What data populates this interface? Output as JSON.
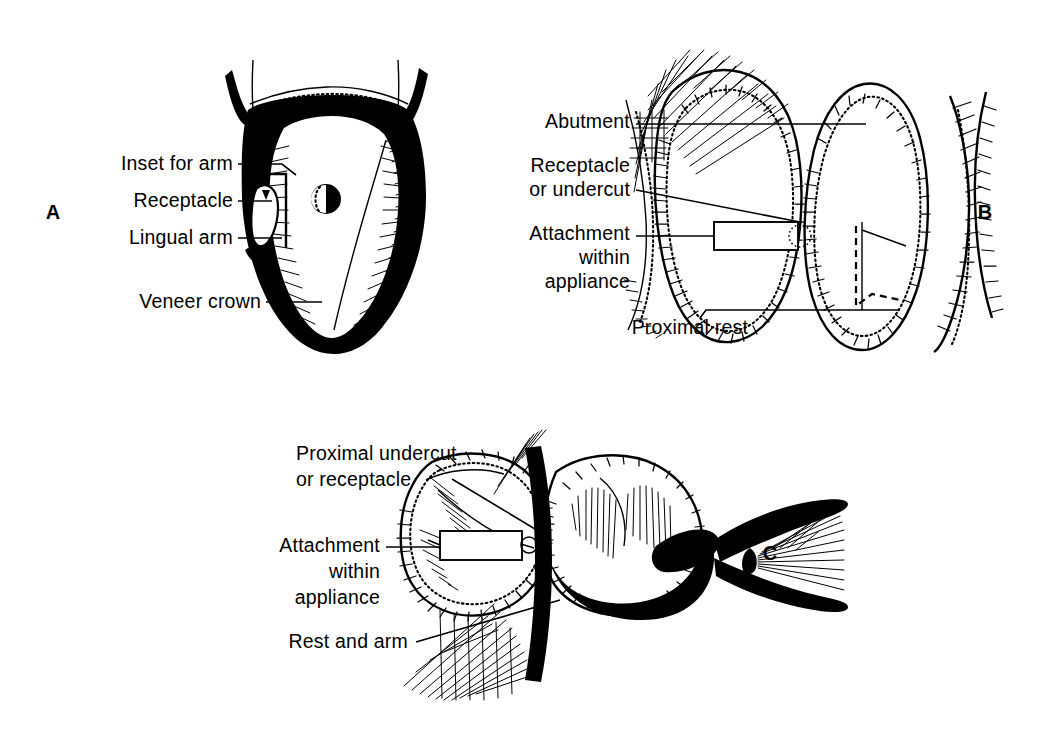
{
  "figure": {
    "background_color": "#ffffff",
    "ink_color": "#000000",
    "width": 1040,
    "height": 733
  },
  "panels": [
    {
      "id": "A",
      "letter": "A",
      "letter_x": 53,
      "letter_y": 219,
      "description": "Cross-section of a veneer crown abutment showing inset, receptacle and lingual arm",
      "labels": [
        {
          "name": "inset-for-arm",
          "text": "Inset for arm",
          "x": 233,
          "y": 170,
          "anchor": "end",
          "leader": "M238,164 L282,164 L296,175"
        },
        {
          "name": "receptacle",
          "text": "Receptacle",
          "x": 233,
          "y": 207,
          "anchor": "end",
          "leader": "M238,201 L272,201"
        },
        {
          "name": "lingual-arm",
          "text": "Lingual arm",
          "x": 233,
          "y": 244,
          "anchor": "end",
          "leader": "M238,238 L282,238"
        },
        {
          "name": "veneer-crown",
          "text": "Veneer crown",
          "x": 261,
          "y": 308,
          "anchor": "end",
          "leader": "M266,302 L322,302"
        }
      ]
    },
    {
      "id": "B",
      "letter": "B",
      "letter_x": 985,
      "letter_y": 219,
      "description": "Proximal view of two abutment teeth with attachment within appliance and proximal rest",
      "labels": [
        {
          "name": "abutment",
          "text": "Abutment",
          "x": 630,
          "y": 128,
          "anchor": "end",
          "leader": "M636,124 L866,124"
        },
        {
          "name": "receptacle-or-undercut-line1",
          "text": "Receptacle",
          "x": 630,
          "y": 172,
          "anchor": "end",
          "leader": ""
        },
        {
          "name": "receptacle-or-undercut-line2",
          "text": "or undercut",
          "x": 630,
          "y": 196,
          "anchor": "end",
          "leader": "M636,190 L800,222"
        },
        {
          "name": "attachment-line1",
          "text": "Attachment",
          "x": 630,
          "y": 240,
          "anchor": "end",
          "leader": "M636,236 L714,236"
        },
        {
          "name": "attachment-line2",
          "text": "within",
          "x": 630,
          "y": 264,
          "anchor": "end",
          "leader": ""
        },
        {
          "name": "attachment-line3",
          "text": "appliance",
          "x": 630,
          "y": 288,
          "anchor": "end",
          "leader": ""
        },
        {
          "name": "proximal-rest",
          "text": "Proximal rest",
          "x": 748,
          "y": 334,
          "anchor": "end",
          "leader": "M700,318 L706,310 L900,310"
        }
      ]
    },
    {
      "id": "C",
      "letter": "C",
      "letter_x": 770,
      "letter_y": 560,
      "description": "Occlusal view showing proximal undercut or receptacle, attachment within appliance and rest with arm",
      "labels": [
        {
          "name": "proximal-undercut-line1",
          "text": "Proximal undercut",
          "x": 296,
          "y": 460,
          "anchor": "start",
          "leader": ""
        },
        {
          "name": "proximal-undercut-line2",
          "text": "or receptacle",
          "x": 296,
          "y": 486,
          "anchor": "start",
          "leader": "M452,479 L540,532"
        },
        {
          "name": "attachment-line1",
          "text": "Attachment",
          "x": 380,
          "y": 552,
          "anchor": "end",
          "leader": "M386,547 L440,547"
        },
        {
          "name": "attachment-line2",
          "text": "within",
          "x": 380,
          "y": 578,
          "anchor": "end",
          "leader": ""
        },
        {
          "name": "attachment-line3",
          "text": "appliance",
          "x": 380,
          "y": 604,
          "anchor": "end",
          "leader": ""
        },
        {
          "name": "rest-and-arm",
          "text": "Rest and arm",
          "x": 408,
          "y": 648,
          "anchor": "end",
          "leader": "M416,642 L560,600"
        }
      ]
    }
  ]
}
